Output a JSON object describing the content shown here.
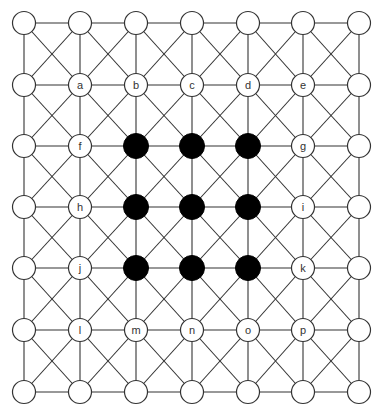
{
  "diagram": {
    "type": "grid-board",
    "columns": 7,
    "rows": 7,
    "col_x": [
      24,
      80,
      136,
      192,
      248,
      303,
      359
    ],
    "row_y": [
      23,
      85,
      146,
      207,
      268,
      330,
      392
    ],
    "node_radius": 11.5,
    "colors": {
      "line": "#333333",
      "filled": "#000000",
      "empty": "#ffffff"
    },
    "connections": [
      "horizontal",
      "vertical",
      "both-diagonals-in-every-cell"
    ],
    "grid": [
      [
        "",
        "",
        "",
        "",
        "",
        "",
        ""
      ],
      [
        "",
        "a",
        "b",
        "c",
        "d",
        "e",
        ""
      ],
      [
        "",
        "f",
        "●",
        "●",
        "●",
        "g",
        ""
      ],
      [
        "",
        "h",
        "●",
        "●",
        "●",
        "i",
        ""
      ],
      [
        "",
        "j",
        "●",
        "●",
        "●",
        "k",
        ""
      ],
      [
        "",
        "l",
        "m",
        "n",
        "o",
        "p",
        ""
      ],
      [
        "",
        "",
        "",
        "",
        "",
        "",
        ""
      ]
    ],
    "labels": [
      "a",
      "b",
      "c",
      "d",
      "e",
      "f",
      "g",
      "h",
      "i",
      "j",
      "k",
      "l",
      "m",
      "n",
      "o",
      "p"
    ],
    "filled_count": 9
  }
}
